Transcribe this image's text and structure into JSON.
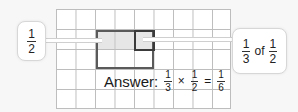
{
  "diagram": {
    "grid": {
      "columns": 9,
      "rows": 5
    },
    "highlight_half": {
      "label_numerator": "1",
      "label_denominator": "2"
    },
    "highlight_third_of_half": {
      "first_numerator": "1",
      "first_denominator": "3",
      "word": "of",
      "second_numerator": "1",
      "second_denominator": "2"
    },
    "answer": {
      "label": "Answer:",
      "a_num": "1",
      "a_den": "3",
      "times": "×",
      "b_num": "1",
      "b_den": "2",
      "equals": "=",
      "c_num": "1",
      "c_den": "6"
    },
    "colors": {
      "grid_line": "#bdbdbd",
      "shade": "#e4e4e4",
      "outline": "#4a4a4a",
      "background": "#f7f7f7"
    }
  }
}
